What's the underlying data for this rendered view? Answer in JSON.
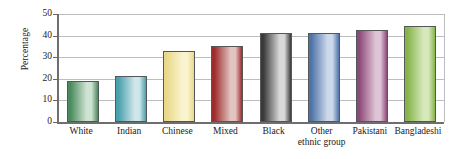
{
  "chart_data": {
    "type": "bar",
    "title": "",
    "subtitle": "",
    "xlabel": "",
    "ylabel": "Percentage",
    "ylim": [
      0,
      50
    ],
    "yticks": [
      0,
      10,
      20,
      30,
      40,
      50
    ],
    "ytick_labels": [
      "0",
      "10",
      "20",
      "30",
      "40",
      "50"
    ],
    "grid": true,
    "legend": false,
    "legend_position": "none",
    "categories": [
      "White",
      "Indian",
      "Chinese",
      "Mixed",
      "Black",
      "Other ethnic group",
      "Pakistani",
      "Bangladeshi"
    ],
    "category_label_lines": [
      [
        "White"
      ],
      [
        "Indian"
      ],
      [
        "Chinese"
      ],
      [
        "Mixed"
      ],
      [
        "Black"
      ],
      [
        "Other",
        "ethnic group"
      ],
      [
        "Pakistani"
      ],
      [
        "Bangladeshi"
      ]
    ],
    "values": [
      19,
      21.5,
      33,
      35,
      41,
      41,
      42.5,
      44.5
    ],
    "bar_colors": [
      "#4a8a5c",
      "#4aa0ac",
      "#e8d98a",
      "#9e2c2c",
      "#3a3a3a",
      "#4f74a8",
      "#8d4a78",
      "#86b44a"
    ],
    "bar_colors_light": [
      "#cfe3d2",
      "#cfe6ea",
      "#faf3cf",
      "#e2c4c0",
      "#d8d8d8",
      "#ccd9ea",
      "#dfc3d6",
      "#d7e8bc"
    ]
  }
}
